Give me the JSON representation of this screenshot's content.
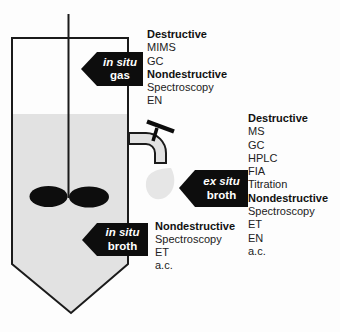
{
  "figure": {
    "description_labels": {
      "gas_arrow": {
        "line1": "in situ",
        "line2": "gas"
      },
      "ex_situ_arrow": {
        "line1": "ex situ",
        "line2": "broth"
      },
      "in_situ_arrow": {
        "line1": "in situ",
        "line2": "broth"
      }
    },
    "method_lists": {
      "gas": {
        "items": [
          {
            "label": "Destructive",
            "bold": true
          },
          {
            "label": "MIMS",
            "bold": false
          },
          {
            "label": "GC",
            "bold": false
          },
          {
            "label": "Nondestructive",
            "bold": true
          },
          {
            "label": "Spectroscopy",
            "bold": false
          },
          {
            "label": "EN",
            "bold": false
          }
        ]
      },
      "ex_situ_broth": {
        "items": [
          {
            "label": "Destructive",
            "bold": true
          },
          {
            "label": "MS",
            "bold": false
          },
          {
            "label": "GC",
            "bold": false
          },
          {
            "label": "HPLC",
            "bold": false
          },
          {
            "label": "FIA",
            "bold": false
          },
          {
            "label": "Titration",
            "bold": false
          },
          {
            "label": "Nondestructive",
            "bold": true
          },
          {
            "label": "Spectroscopy",
            "bold": false
          },
          {
            "label": "ET",
            "bold": false
          },
          {
            "label": "EN",
            "bold": false
          },
          {
            "label": "a.c.",
            "bold": false
          }
        ]
      },
      "in_situ_broth": {
        "items": [
          {
            "label": "Nondestructive",
            "bold": true
          },
          {
            "label": "Spectroscopy",
            "bold": false
          },
          {
            "label": "ET",
            "bold": false
          },
          {
            "label": "a.c.",
            "bold": false
          }
        ]
      }
    },
    "colors": {
      "arrow_fill": "#0d0d0d",
      "arrow_text": "#ffffff",
      "liquid": "#e2e2e2",
      "droplet": "#e6e6e6",
      "outline": "#1b1b1b",
      "impeller": "#0d0d0d",
      "background": "#fdfdfd"
    }
  }
}
